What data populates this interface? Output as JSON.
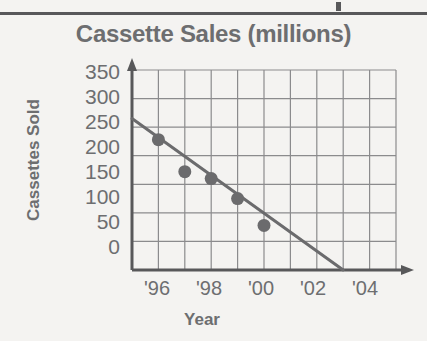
{
  "chart_data": {
    "type": "scatter",
    "title": "Cassette Sales (millions)",
    "xlabel": "Year",
    "ylabel": "Cassettes Sold",
    "grid": true,
    "legend": null,
    "xlim": [
      1995,
      2005
    ],
    "ylim": [
      0,
      350
    ],
    "ytick_values": [
      350,
      300,
      250,
      200,
      150,
      100,
      50,
      0
    ],
    "ytick_labels": [
      "350",
      "300",
      "250",
      "200",
      "150",
      "100",
      "50",
      "0"
    ],
    "xtick_values": [
      1996,
      1998,
      2000,
      2002,
      2004
    ],
    "xtick_labels": [
      "'96",
      "'98",
      "'00",
      "'02",
      "'04"
    ],
    "x": [
      1996,
      1997,
      1998,
      1999,
      2000
    ],
    "values": [
      228,
      172,
      160,
      125,
      78
    ],
    "points": [
      {
        "x": 1996,
        "y": 228,
        "label": "'96"
      },
      {
        "x": 1997,
        "y": 172,
        "label": "'97"
      },
      {
        "x": 1998,
        "y": 160,
        "label": "'98"
      },
      {
        "x": 1999,
        "y": 125,
        "label": "'99"
      },
      {
        "x": 2000,
        "y": 78,
        "label": "'00"
      }
    ],
    "trend_line": {
      "name": "line of best fit",
      "x_start": 1995,
      "y_start": 265,
      "x_end": 2003,
      "y_end": 0
    },
    "colors": {
      "marker": "#6b6b6d",
      "line": "#6b6b6d",
      "grid": "#8b8b8d",
      "axis": "#58585a",
      "text": "#6d6e70",
      "background": "#f4f3f1"
    }
  },
  "top_rule": {
    "present": true
  }
}
